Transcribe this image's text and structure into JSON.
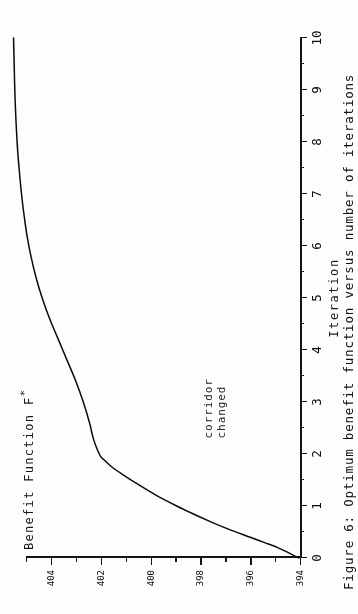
{
  "figure": {
    "caption": "Figure 6: Optimum benefit function versus number of iterations",
    "annotation_line1": "corridor",
    "annotation_line2": "changed",
    "yaxis_title_text": "Benefit Function F",
    "yaxis_title_star": "*",
    "ink_color": "#101010",
    "paper_color": "#fdfdfd"
  },
  "chart_data": {
    "type": "line",
    "title": "Figure 6: Optimum benefit function versus number of iterations",
    "xlabel": "Iteration",
    "ylabel": "Benefit Function F*",
    "xlim": [
      0,
      10
    ],
    "ylim": [
      394,
      405
    ],
    "grid": false,
    "legend": null,
    "xticks": [
      0,
      1,
      2,
      3,
      4,
      5,
      6,
      7,
      8,
      9,
      10
    ],
    "xticklabels": [
      "0",
      "1",
      "2",
      "3",
      "4",
      "5",
      "6",
      "7",
      "8",
      "9",
      "10"
    ],
    "xminorticks": [
      0.5,
      1.5,
      2.5,
      3.5,
      4.5,
      5.5,
      6.5,
      7.5,
      8.5,
      9.5
    ],
    "yticks": [
      394,
      396,
      398,
      400,
      402,
      404
    ],
    "yticklabels": [
      "394",
      "396",
      "398",
      "400",
      "402",
      "404"
    ],
    "yminorticks": [
      395,
      397,
      399,
      401,
      403,
      405
    ],
    "annotations": [
      {
        "text": "corridor changed",
        "x": 2.3,
        "y": 397.4
      }
    ],
    "series": [
      {
        "name": "Optimum benefit function",
        "x": [
          0.0,
          0.1,
          0.2,
          0.3,
          0.4,
          0.55,
          0.7,
          0.85,
          1.0,
          1.2,
          1.4,
          1.6,
          1.75,
          1.88,
          1.95,
          2.1,
          2.3,
          2.6,
          3.0,
          3.4,
          3.8,
          4.2,
          4.6,
          5.0,
          5.4,
          5.8,
          6.2,
          6.6,
          7.0,
          7.4,
          7.8,
          8.2,
          8.6,
          9.0,
          9.4,
          10.0
        ],
        "y": [
          394.05,
          394.45,
          394.9,
          395.45,
          396.0,
          396.85,
          397.6,
          398.3,
          398.95,
          399.75,
          400.45,
          401.1,
          401.55,
          401.85,
          402.0,
          402.15,
          402.3,
          402.45,
          402.7,
          403.0,
          403.35,
          403.7,
          404.05,
          404.35,
          404.6,
          404.8,
          404.96,
          405.08,
          405.18,
          405.26,
          405.33,
          405.38,
          405.42,
          405.45,
          405.47,
          405.5
        ]
      }
    ]
  },
  "xaxis": {
    "title": "Iteration",
    "labels": [
      "0",
      "1",
      "2",
      "3",
      "4",
      "5",
      "6",
      "7",
      "8",
      "9",
      "10"
    ]
  },
  "yaxis": {
    "labels": [
      "404",
      "402",
      "400",
      "398",
      "396",
      "394"
    ]
  }
}
